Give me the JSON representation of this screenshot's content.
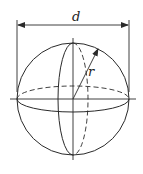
{
  "diagram": {
    "labels": {
      "diameter": "d",
      "radius": "r"
    },
    "colors": {
      "stroke": "#2a2a2a",
      "background": "#ffffff"
    }
  }
}
